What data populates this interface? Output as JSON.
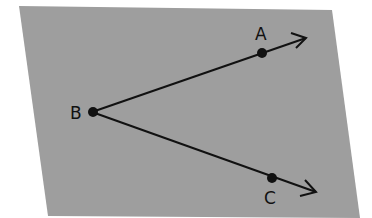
{
  "diagram": {
    "type": "geometry-angle",
    "colors": {
      "plane": "#9e9e9e",
      "background": "#ffffff",
      "ink": "#111111"
    },
    "points": [
      {
        "label": "A",
        "x": 262,
        "y": 53
      },
      {
        "label": "B",
        "x": 92,
        "y": 112
      },
      {
        "label": "C",
        "x": 272,
        "y": 178
      }
    ],
    "rays": [
      {
        "from": "B",
        "through": "A"
      },
      {
        "from": "B",
        "through": "C"
      }
    ]
  }
}
